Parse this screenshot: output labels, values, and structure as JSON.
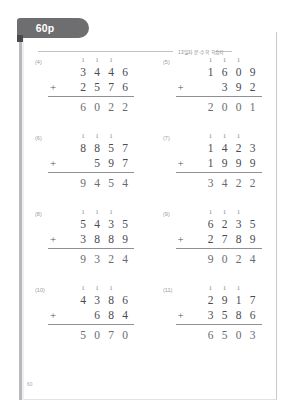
{
  "tab": {
    "label": "60p"
  },
  "header": {
    "running_head": "13일차  문·수학 학습지"
  },
  "footer": {
    "page_number": "60"
  },
  "colors": {
    "tab_bg": "#6e6e70",
    "tab_text": "#ffffff",
    "digit": "#4a4a50",
    "answer_digit": "#6a6a70",
    "carry": "#8a8a90",
    "rule": "#8f8f95"
  },
  "problems": [
    {
      "number": "(4)",
      "carries": [
        "1",
        "1",
        "1",
        ""
      ],
      "addend1": [
        "3",
        "4",
        "4",
        "6"
      ],
      "addend2": [
        "",
        "2",
        "5",
        "7",
        "6"
      ],
      "operator": "+",
      "answer": [
        "6",
        "0",
        "2",
        "2"
      ]
    },
    {
      "number": "(5)",
      "carries": [
        "1",
        "1",
        "1",
        ""
      ],
      "addend1": [
        "1",
        "6",
        "0",
        "9"
      ],
      "addend2": [
        "",
        "",
        "3",
        "9",
        "2"
      ],
      "operator": "+",
      "answer": [
        "2",
        "0",
        "0",
        "1"
      ]
    },
    {
      "number": "(6)",
      "carries": [
        "1",
        "1",
        "1",
        ""
      ],
      "addend1": [
        "8",
        "8",
        "5",
        "7"
      ],
      "addend2": [
        "",
        "",
        "5",
        "9",
        "7"
      ],
      "operator": "+",
      "answer": [
        "9",
        "4",
        "5",
        "4"
      ]
    },
    {
      "number": "(7)",
      "carries": [
        "1",
        "1",
        "1",
        ""
      ],
      "addend1": [
        "1",
        "4",
        "2",
        "3"
      ],
      "addend2": [
        "",
        "1",
        "9",
        "9",
        "9"
      ],
      "operator": "+",
      "answer": [
        "3",
        "4",
        "2",
        "2"
      ]
    },
    {
      "number": "(8)",
      "carries": [
        "1",
        "1",
        "1",
        ""
      ],
      "addend1": [
        "5",
        "4",
        "3",
        "5"
      ],
      "addend2": [
        "",
        "3",
        "8",
        "8",
        "9"
      ],
      "operator": "+",
      "answer": [
        "9",
        "3",
        "2",
        "4"
      ]
    },
    {
      "number": "(9)",
      "carries": [
        "1",
        "1",
        "1",
        ""
      ],
      "addend1": [
        "6",
        "2",
        "3",
        "5"
      ],
      "addend2": [
        "",
        "2",
        "7",
        "8",
        "9"
      ],
      "operator": "+",
      "answer": [
        "9",
        "0",
        "2",
        "4"
      ]
    },
    {
      "number": "(10)",
      "carries": [
        "1",
        "1",
        "1",
        ""
      ],
      "addend1": [
        "4",
        "3",
        "8",
        "6"
      ],
      "addend2": [
        "",
        "",
        "6",
        "8",
        "4"
      ],
      "operator": "+",
      "answer": [
        "5",
        "0",
        "7",
        "0"
      ]
    },
    {
      "number": "(11)",
      "carries": [
        "1",
        "1",
        "1",
        ""
      ],
      "addend1": [
        "2",
        "9",
        "1",
        "7"
      ],
      "addend2": [
        "",
        "3",
        "5",
        "8",
        "6"
      ],
      "operator": "+",
      "answer": [
        "6",
        "5",
        "0",
        "3"
      ]
    }
  ]
}
